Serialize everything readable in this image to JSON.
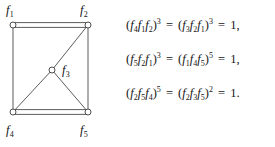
{
  "figure": {
    "kind": "graph-with-relations",
    "background_color": "#ffffff",
    "ink_color": "#1a1a1a"
  },
  "graph": {
    "vertex_style": "open-circle",
    "vertex_radius": 3,
    "vertex_fill": "#ffffff",
    "vertex_stroke": "#3c3c3c",
    "edge_stroke": "#4a4a4a",
    "nodes": [
      {
        "id": "f1",
        "label_base": "f",
        "label_sub": "1",
        "x": 13,
        "y": 25,
        "label_x": 6,
        "label_y": 4
      },
      {
        "id": "f2",
        "label_base": "f",
        "label_sub": "2",
        "x": 88,
        "y": 25,
        "label_x": 80,
        "label_y": 4
      },
      {
        "id": "f3",
        "label_base": "f",
        "label_sub": "3",
        "x": 52,
        "y": 70,
        "label_x": 62,
        "label_y": 64
      },
      {
        "id": "f4",
        "label_base": "f",
        "label_sub": "4",
        "x": 13,
        "y": 112,
        "label_x": 6,
        "label_y": 124
      },
      {
        "id": "f5",
        "label_base": "f",
        "label_sub": "5",
        "x": 88,
        "y": 112,
        "label_x": 80,
        "label_y": 124
      }
    ],
    "edges": [
      {
        "from": "f1",
        "to": "f2",
        "style": "double"
      },
      {
        "from": "f4",
        "to": "f5",
        "style": "double"
      },
      {
        "from": "f1",
        "to": "f4",
        "style": "single"
      },
      {
        "from": "f2",
        "to": "f5",
        "style": "single"
      },
      {
        "from": "f2",
        "to": "f3",
        "style": "single"
      },
      {
        "from": "f3",
        "to": "f4",
        "style": "single"
      },
      {
        "from": "f3",
        "to": "f5",
        "style": "single"
      }
    ]
  },
  "relations": [
    {
      "id": "relation-1",
      "terms": [
        {
          "factors": [
            {
              "base": "f",
              "sub": "4"
            },
            {
              "base": "f",
              "sub": "1"
            },
            {
              "base": "f",
              "sub": "2"
            }
          ],
          "exponent": "3"
        },
        {
          "factors": [
            {
              "base": "f",
              "sub": "3"
            },
            {
              "base": "f",
              "sub": "2"
            },
            {
              "base": "f",
              "sub": "1"
            }
          ],
          "exponent": "3"
        }
      ],
      "value": "1",
      "terminator": ",",
      "plain": "(f4f1f2)^3 = (f3f2f1)^3 = 1,"
    },
    {
      "id": "relation-2",
      "terms": [
        {
          "factors": [
            {
              "base": "f",
              "sub": "5"
            },
            {
              "base": "f",
              "sub": "2"
            },
            {
              "base": "f",
              "sub": "1"
            }
          ],
          "exponent": "3"
        },
        {
          "factors": [
            {
              "base": "f",
              "sub": "1"
            },
            {
              "base": "f",
              "sub": "4"
            },
            {
              "base": "f",
              "sub": "5"
            }
          ],
          "exponent": "5"
        }
      ],
      "value": "1",
      "terminator": ",",
      "plain": "(f5f2f1)^3 = (f1f4f5)^5 = 1,"
    },
    {
      "id": "relation-3",
      "terms": [
        {
          "factors": [
            {
              "base": "f",
              "sub": "2"
            },
            {
              "base": "f",
              "sub": "5"
            },
            {
              "base": "f",
              "sub": "4"
            }
          ],
          "exponent": "5"
        },
        {
          "factors": [
            {
              "base": "f",
              "sub": "2"
            },
            {
              "base": "f",
              "sub": "3"
            },
            {
              "base": "f",
              "sub": "5"
            }
          ],
          "exponent": "2"
        }
      ],
      "value": "1",
      "terminator": ".",
      "plain": "(f2f5f4)^5 = (f2f3f5)^2 = 1."
    }
  ],
  "symbols": {
    "equals": "=",
    "open_paren": "(",
    "close_paren": ")"
  }
}
